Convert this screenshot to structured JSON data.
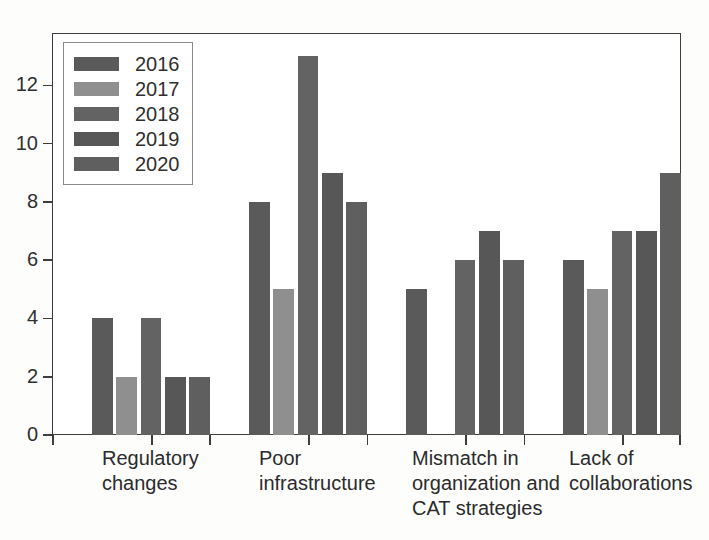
{
  "chart_data": {
    "type": "bar",
    "title": "",
    "xlabel": "",
    "ylabel": "",
    "grid": false,
    "legend_position": "top-left",
    "ylim": [
      0,
      13.8
    ],
    "yticks": [
      0,
      2,
      4,
      6,
      8,
      10,
      12
    ],
    "ytick_labels": [
      "0",
      "2",
      "4",
      "6",
      "8",
      "10",
      "12"
    ],
    "categories": [
      "Regulatory\nchanges",
      "Poor\ninfrastructure",
      "Mismatch in\norganization and\nCAT strategies",
      "Lack of\ncollaborations"
    ],
    "series": [
      {
        "name": "2016",
        "color": "#5a5a5a",
        "values": [
          4,
          8,
          5,
          6
        ]
      },
      {
        "name": "2017",
        "color": "#8f8f8f",
        "values": [
          2,
          5,
          0,
          5
        ]
      },
      {
        "name": "2018",
        "color": "#636363",
        "values": [
          4,
          13,
          6,
          7
        ]
      },
      {
        "name": "2019",
        "color": "#575757",
        "values": [
          2,
          9,
          7,
          7
        ]
      },
      {
        "name": "2020",
        "color": "#5f5f5f",
        "values": [
          2,
          8,
          6,
          9
        ]
      }
    ]
  },
  "legend": {
    "items": [
      {
        "label": "2016",
        "color": "#5a5a5a"
      },
      {
        "label": "2017",
        "color": "#8f8f8f"
      },
      {
        "label": "2018",
        "color": "#636363"
      },
      {
        "label": "2019",
        "color": "#575757"
      },
      {
        "label": "2020",
        "color": "#5f5f5f"
      }
    ]
  },
  "axes": {
    "y_tick_labels": [
      "0",
      "2",
      "4",
      "6",
      "8",
      "10",
      "12"
    ],
    "x_tick_labels": [
      "Regulatory\nchanges",
      "Poor\ninfrastructure",
      "Mismatch in\norganization and\nCAT strategies",
      "Lack of\ncollaborations"
    ]
  }
}
